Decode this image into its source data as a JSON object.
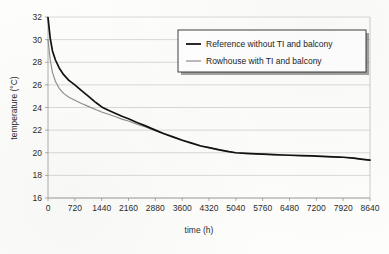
{
  "chart_data": {
    "type": "line",
    "title": "",
    "xlabel": "time (h)",
    "ylabel": "temperature (°C)",
    "xlim": [
      0,
      8640
    ],
    "ylim": [
      16,
      32
    ],
    "grid": true,
    "legend_position": "upper-right",
    "xticks": [
      0,
      720,
      1440,
      2160,
      2880,
      3600,
      4320,
      5040,
      5760,
      6480,
      7200,
      7920,
      8640
    ],
    "xtick_labels": [
      "0",
      "720",
      "1440",
      "2160",
      "2880",
      "3600",
      "4320",
      "5040",
      "5760",
      "6480",
      "7200",
      "7920",
      "8640"
    ],
    "yticks": [
      16,
      18,
      20,
      22,
      24,
      26,
      28,
      30,
      32
    ],
    "ytick_labels": [
      "16",
      "18",
      "20",
      "22",
      "24",
      "26",
      "28",
      "30",
      "32"
    ],
    "series": [
      {
        "name": "Reference without TI and balcony",
        "color": "#111111",
        "x": [
          0,
          60,
          120,
          200,
          300,
          420,
          560,
          720,
          900,
          1080,
          1260,
          1320,
          1440,
          1620,
          1800,
          2000,
          2160,
          2400,
          2600,
          2880,
          3100,
          3350,
          3600,
          3850,
          4100,
          4320,
          4600,
          4850,
          5040,
          5300,
          5600,
          5760,
          6050,
          6300,
          6480,
          6800,
          7100,
          7200,
          7500,
          7800,
          7920,
          8200,
          8450,
          8640
        ],
        "values": [
          31.95,
          30.1,
          29.0,
          28.2,
          27.5,
          26.9,
          26.4,
          26.0,
          25.5,
          25.0,
          24.5,
          24.35,
          24.05,
          23.75,
          23.5,
          23.2,
          23.0,
          22.65,
          22.4,
          22.0,
          21.7,
          21.4,
          21.1,
          20.85,
          20.6,
          20.45,
          20.25,
          20.1,
          20.0,
          19.95,
          19.9,
          19.88,
          19.84,
          19.8,
          19.78,
          19.75,
          19.72,
          19.7,
          19.66,
          19.62,
          19.6,
          19.52,
          19.42,
          19.35
        ]
      },
      {
        "name": "Rowhouse with TI and balcony",
        "color": "#8e8e8e",
        "x": [
          0,
          60,
          120,
          200,
          300,
          420,
          560,
          720,
          900,
          1080,
          1260,
          1440,
          1620,
          1800,
          2000,
          2160,
          2400,
          2600,
          2880,
          3100,
          3350,
          3600,
          3850,
          4100,
          4320,
          4600,
          4850,
          5040,
          5300,
          5600,
          5760,
          6050,
          6300,
          6480,
          6800,
          7100,
          7200,
          7500,
          7800,
          7920,
          8200,
          8450,
          8640
        ],
        "values": [
          30.0,
          28.2,
          27.1,
          26.3,
          25.7,
          25.25,
          24.9,
          24.65,
          24.35,
          24.1,
          23.85,
          23.6,
          23.4,
          23.2,
          22.95,
          22.8,
          22.5,
          22.3,
          21.95,
          21.68,
          21.4,
          21.12,
          20.88,
          20.62,
          20.45,
          20.25,
          20.1,
          20.0,
          19.95,
          19.9,
          19.88,
          19.84,
          19.8,
          19.78,
          19.75,
          19.72,
          19.7,
          19.66,
          19.62,
          19.6,
          19.52,
          19.42,
          19.35
        ]
      }
    ]
  },
  "legend": {
    "entries": [
      {
        "label": "Reference without TI and balcony"
      },
      {
        "label": "Rowhouse with TI and balcony"
      }
    ]
  }
}
